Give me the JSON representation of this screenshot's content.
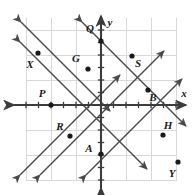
{
  "figure": {
    "type": "coordinate-plane",
    "axis_labels": {
      "x": "x",
      "y": "y"
    },
    "origin_px": [
      101,
      105
    ],
    "unit_px": 12.5,
    "grid_px": 25,
    "grid_rect": {
      "x": 26,
      "y": 18,
      "width": 151,
      "height": 162
    },
    "colors": {
      "background": "#ffffff",
      "grid": "#d7d7dc",
      "axis": "#3c3c3c",
      "line": "#4a4a4a",
      "point": "#1a1a1a",
      "label": "#1a1a1a"
    }
  },
  "chart_data": {
    "type": "scatter",
    "title": "",
    "xlabel": "x",
    "ylabel": "y",
    "xlim": [
      -6,
      6
    ],
    "ylim": [
      -6,
      6
    ],
    "grid": true,
    "legend": "none",
    "points": [
      {
        "label": "Q",
        "x": 0,
        "y": 5,
        "px": 101,
        "py": 41,
        "lx": 90,
        "ly": 32
      },
      {
        "label": "X",
        "x": -5,
        "y": 4,
        "px": 38,
        "py": 53,
        "lx": 30,
        "ly": 68
      },
      {
        "label": "G",
        "x": -1,
        "y": 3,
        "px": 88,
        "py": 69,
        "lx": 76,
        "ly": 62
      },
      {
        "label": "S",
        "x": 2.5,
        "y": 4,
        "px": 132,
        "py": 56,
        "lx": 138,
        "ly": 67
      },
      {
        "label": "P",
        "x": -4,
        "y": 0,
        "px": 51,
        "py": 105,
        "lx": 42,
        "ly": 97
      },
      {
        "label": "B",
        "x": 4,
        "y": 1,
        "px": 148,
        "py": 90,
        "lx": 153,
        "ly": 101
      },
      {
        "label": "R",
        "x": -2.5,
        "y": -2.5,
        "px": 70,
        "py": 136,
        "lx": 60,
        "ly": 130
      },
      {
        "label": "A",
        "x": 0,
        "y": -4,
        "px": 101,
        "py": 154,
        "lx": 89,
        "ly": 152
      },
      {
        "label": "H",
        "x": 5,
        "y": -2.5,
        "px": 163,
        "py": 135,
        "lx": 168,
        "ly": 129
      },
      {
        "label": "Y",
        "x": 6,
        "y": -4.5,
        "px": 178,
        "py": 162,
        "lx": 172,
        "ly": 177
      }
    ],
    "lines": [
      {
        "name": "line-negative-upper",
        "slope": -1,
        "through": "X",
        "x1": 21,
        "y1": 22,
        "x2": 110,
        "y2": 111
      },
      {
        "name": "line-negative-middle",
        "slope": -1,
        "through": "P-G",
        "x1": 20,
        "y1": 42,
        "x2": 147,
        "y2": 169
      },
      {
        "name": "line-negative-lower",
        "slope": -1,
        "through": "H-Q",
        "x1": 82,
        "y1": 22,
        "x2": 186,
        "y2": 126
      },
      {
        "name": "line-positive-left",
        "slope": 1,
        "through": "P-A",
        "x1": 20,
        "y1": 175,
        "x2": 120,
        "y2": 75
      },
      {
        "name": "line-positive-middle",
        "slope": 1,
        "through": "G-S",
        "x1": 40,
        "y1": 175,
        "x2": 164,
        "y2": 51
      },
      {
        "name": "line-positive-right",
        "slope": 1,
        "through": "A-B",
        "x1": 86,
        "y1": 175,
        "x2": 182,
        "y2": 79
      }
    ],
    "x_ticks": [
      -6,
      -5,
      -4,
      -3,
      -2,
      -1,
      1,
      2,
      3,
      4,
      5,
      6
    ],
    "y_ticks": [
      -6,
      -5,
      -4,
      -3,
      -2,
      -1,
      1,
      2,
      3,
      4,
      5,
      6
    ]
  }
}
